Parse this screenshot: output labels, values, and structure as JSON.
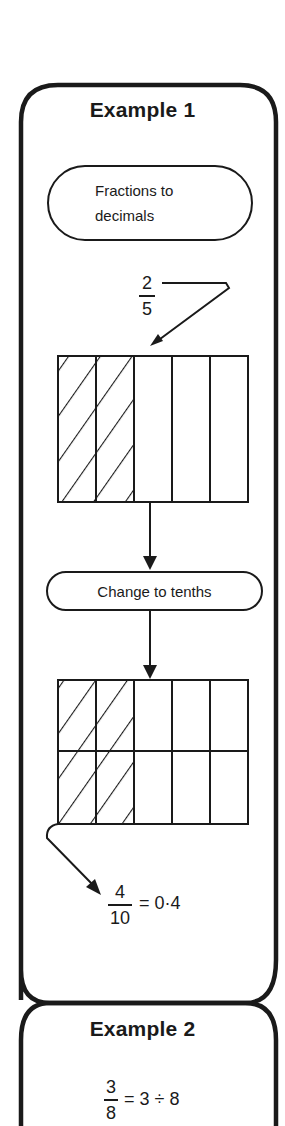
{
  "example1": {
    "title": "Example 1",
    "start_capsule": {
      "line1": "Fractions to",
      "line2": "decimals"
    },
    "input_fraction": {
      "numerator": "2",
      "denominator": "5"
    },
    "grid_fifths": {
      "columns": 5,
      "rows": 1,
      "shaded_columns": 2
    },
    "step_capsule": {
      "label": "Change to tenths"
    },
    "grid_tenths": {
      "columns": 5,
      "rows": 2,
      "shaded_columns": 2
    },
    "result": {
      "numerator": "4",
      "denominator": "10",
      "equals": "= 0·4"
    }
  },
  "example2": {
    "title": "Example 2",
    "equation": {
      "numerator": "3",
      "denominator": "8",
      "rest": "= 3 ÷ 8"
    }
  },
  "colors": {
    "ink": "#1a1a1a",
    "paper": "#ffffff"
  }
}
